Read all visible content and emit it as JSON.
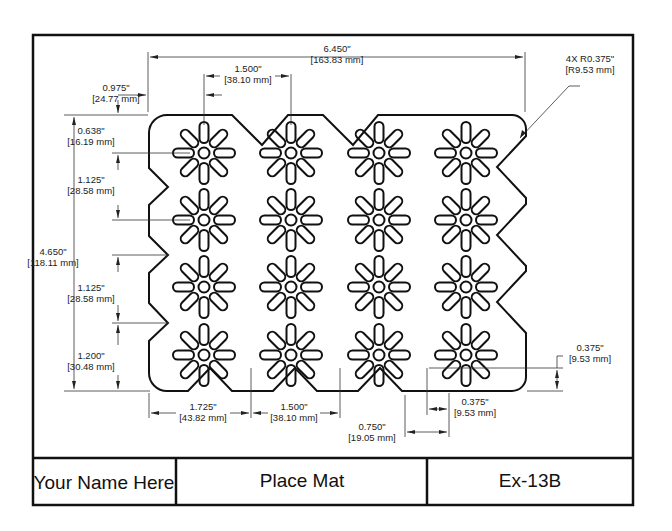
{
  "title_block": {
    "name": "Your Name Here",
    "title": "Place Mat",
    "drawing_number": "Ex-13B"
  },
  "dimensions": {
    "overall_width": {
      "inch": "6.450\"",
      "mm": "[163.83 mm]"
    },
    "corner_radius": {
      "inch": "4X R0.375\"",
      "mm": "[R9.53 mm]"
    },
    "first_col_offset": {
      "inch": "0.975\"",
      "mm": "[24.77 mm]"
    },
    "col_spacing_top": {
      "inch": "1.500\"",
      "mm": "[38.10 mm]"
    },
    "first_row_offset": {
      "inch": "0.638\"",
      "mm": "[16.19 mm]"
    },
    "row_spacing_1": {
      "inch": "1.125\"",
      "mm": "[28.58 mm]"
    },
    "overall_height": {
      "inch": "4.650\"",
      "mm": "[118.11 mm]"
    },
    "row_spacing_2": {
      "inch": "1.125\"",
      "mm": "[28.58 mm]"
    },
    "bottom_notch_offset": {
      "inch": "1.200\"",
      "mm": "[30.48 mm]"
    },
    "bottom_first_notch": {
      "inch": "1.725\"",
      "mm": "[43.82 mm]"
    },
    "bottom_notch_spacing": {
      "inch": "1.500\"",
      "mm": "[38.10 mm]"
    },
    "notch_width": {
      "inch": "0.750\"",
      "mm": "[19.05 mm]"
    },
    "notch_half_width": {
      "inch": "0.375\"",
      "mm": "[9.53 mm]"
    },
    "notch_depth": {
      "inch": "0.375\"",
      "mm": "[9.53 mm]"
    }
  },
  "pattern": {
    "columns": 4,
    "rows": 4,
    "petals_per_flower": 8
  }
}
